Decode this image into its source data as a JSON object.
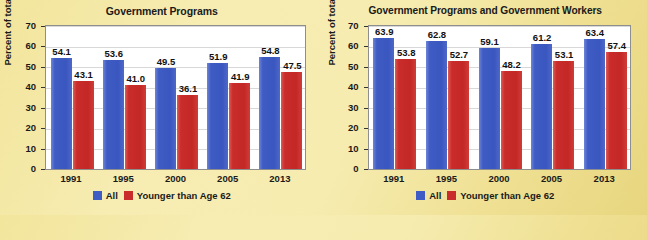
{
  "legend": {
    "series": [
      {
        "label": "All",
        "color": "#3f5cc4",
        "swatch_name": "legend-swatch-all"
      },
      {
        "label": "Younger than Age 62",
        "color": "#c92c2b",
        "swatch_name": "legend-swatch-younger"
      }
    ]
  },
  "axis": {
    "ylabel": "Percent of total",
    "yticks": [
      "0",
      "10",
      "20",
      "30",
      "40",
      "50",
      "60",
      "70"
    ]
  },
  "chart_data": [
    {
      "type": "bar",
      "title": "Government Programs",
      "xlabel": "",
      "ylabel": "Percent of total",
      "ylim": [
        0,
        70
      ],
      "ytick_step": 10,
      "grid": true,
      "legend_position": "bottom",
      "categories": [
        "1991",
        "1995",
        "2000",
        "2005",
        "2013"
      ],
      "series": [
        {
          "name": "All",
          "color": "#3f5cc4",
          "values": [
            54.1,
            53.6,
            49.5,
            51.9,
            54.8
          ]
        },
        {
          "name": "Younger than Age 62",
          "color": "#c92c2b",
          "values": [
            43.1,
            41.0,
            36.1,
            41.9,
            47.5
          ]
        }
      ],
      "value_labels": {
        "All": [
          "54.1",
          "53.6",
          "49.5",
          "51.9",
          "54.8"
        ],
        "Younger than Age 62": [
          "43.1",
          "41.0",
          "36.1",
          "41.9",
          "47.5"
        ]
      }
    },
    {
      "type": "bar",
      "title": "Government Programs and Government Workers",
      "xlabel": "",
      "ylabel": "Percent of total",
      "ylim": [
        0,
        70
      ],
      "ytick_step": 10,
      "grid": true,
      "legend_position": "bottom",
      "categories": [
        "1991",
        "1995",
        "2000",
        "2005",
        "2013"
      ],
      "series": [
        {
          "name": "All",
          "color": "#3f5cc4",
          "values": [
            63.9,
            62.8,
            59.1,
            61.2,
            63.4
          ]
        },
        {
          "name": "Younger than Age 62",
          "color": "#c92c2b",
          "values": [
            53.8,
            52.7,
            48.2,
            53.1,
            57.4
          ]
        }
      ],
      "value_labels": {
        "All": [
          "63.9",
          "62.8",
          "59.1",
          "61.2",
          "63.4"
        ],
        "Younger than Age 62": [
          "53.8",
          "52.7",
          "48.2",
          "53.1",
          "57.4"
        ]
      }
    }
  ]
}
